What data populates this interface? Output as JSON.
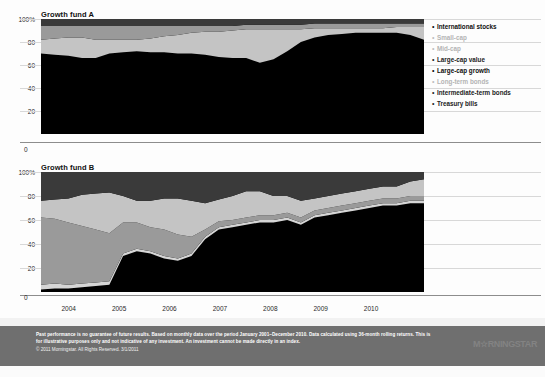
{
  "charts": [
    {
      "title": "Growth fund A",
      "yticks": [
        "100%",
        "80",
        "60",
        "40",
        "20"
      ],
      "zero_label": "0"
    },
    {
      "title": "Growth fund B",
      "yticks": [
        "100%",
        "80",
        "60",
        "40",
        "20"
      ],
      "zero_label": "0"
    }
  ],
  "xaxis": {
    "ticks": [
      "2004",
      "2005",
      "2006",
      "2007",
      "2008",
      "2009",
      "2010"
    ]
  },
  "legend": {
    "items": [
      {
        "label": "International stocks",
        "bullet": "•",
        "emphasis": "strong",
        "color": "#3a3a3a"
      },
      {
        "label": "Small-cap",
        "bullet": "•",
        "emphasis": "faded",
        "color": "#c9c9c9"
      },
      {
        "label": "Mid-cap",
        "bullet": "•",
        "emphasis": "faded",
        "color": "#bdbdbd"
      },
      {
        "label": "Large-cap value",
        "bullet": "•",
        "emphasis": "normal",
        "color": "#9a9a9a"
      },
      {
        "label": "Large-cap growth",
        "bullet": "•",
        "emphasis": "strong",
        "color": "#c4c4c4"
      },
      {
        "label": "Long-term bonds",
        "bullet": "•",
        "emphasis": "faded",
        "color": "#d5d5d5"
      },
      {
        "label": "Intermediate-term bonds",
        "bullet": "•",
        "emphasis": "normal",
        "color": "#1a1a1a"
      },
      {
        "label": "Treasury bills",
        "bullet": "•",
        "emphasis": "normal",
        "color": "#000000"
      }
    ]
  },
  "footer": {
    "disclaimer": "Past performance is no guarantee of future results. Based on monthly data over the period January 2001–December 2010. Data calculated using 36-month rolling returns. This is for illustrative purposes only and not indicative of any investment. An investment cannot be made directly in an index.",
    "copyright": "© 2011 Morningstar. All Rights Reserved. 3/1/2011",
    "logo": "M☆RNINGSTAR"
  },
  "chart_data": {
    "type": "area",
    "xlabel": "",
    "ylabel": "",
    "ylim": [
      0,
      100
    ],
    "grid": true,
    "legend_position": "right",
    "x": [
      "2003-12",
      "2004-03",
      "2004-06",
      "2004-09",
      "2004-12",
      "2005-03",
      "2005-06",
      "2005-09",
      "2005-12",
      "2006-03",
      "2006-06",
      "2006-09",
      "2006-12",
      "2007-03",
      "2007-06",
      "2007-09",
      "2007-12",
      "2008-03",
      "2008-06",
      "2008-09",
      "2008-12",
      "2009-03",
      "2009-06",
      "2009-09",
      "2009-12",
      "2010-03",
      "2010-06",
      "2010-09",
      "2010-12"
    ],
    "panels": [
      {
        "name": "Growth fund A",
        "series": [
          {
            "name": "Treasury bills",
            "color": "#000000",
            "values": [
              70,
              69,
              68,
              66,
              66,
              70,
              71,
              72,
              71,
              71,
              70,
              70,
              69,
              67,
              66,
              66,
              62,
              65,
              72,
              80,
              84,
              86,
              87,
              88,
              88,
              88,
              88,
              86,
              82
            ]
          },
          {
            "name": "Intermediate-term bonds",
            "color": "#1a1a1a",
            "values": [
              0,
              0,
              0,
              0,
              0,
              0,
              0,
              0,
              0,
              0,
              0,
              0,
              0,
              0,
              0,
              0,
              0,
              0,
              0,
              0,
              0,
              0,
              0,
              0,
              0,
              0,
              0,
              0,
              0
            ]
          },
          {
            "name": "Long-term bonds",
            "color": "#d5d5d5",
            "values": [
              0,
              0,
              0,
              0,
              0,
              0,
              0,
              0,
              0,
              0,
              0,
              0,
              0,
              0,
              0,
              0,
              0,
              0,
              0,
              0,
              0,
              0,
              0,
              0,
              0,
              0,
              0,
              0,
              0
            ]
          },
          {
            "name": "Large-cap growth",
            "color": "#c4c4c4",
            "values": [
              12,
              14,
              16,
              18,
              16,
              12,
              11,
              10,
              12,
              14,
              16,
              18,
              20,
              22,
              24,
              25,
              29,
              26,
              19,
              11,
              8,
              6,
              5,
              4,
              4,
              4,
              5,
              7,
              11
            ]
          },
          {
            "name": "Large-cap value",
            "color": "#9a9a9a",
            "values": [
              12,
              11,
              10,
              10,
              12,
              12,
              12,
              12,
              11,
              9,
              8,
              6,
              5,
              5,
              4,
              4,
              4,
              4,
              4,
              4,
              4,
              4,
              4,
              4,
              4,
              4,
              3,
              3,
              3
            ]
          },
          {
            "name": "Mid-cap",
            "color": "#bdbdbd",
            "values": [
              0,
              0,
              0,
              0,
              0,
              0,
              0,
              0,
              0,
              0,
              0,
              0,
              0,
              0,
              0,
              0,
              0,
              0,
              0,
              0,
              0,
              0,
              0,
              0,
              0,
              0,
              0,
              0,
              0
            ]
          },
          {
            "name": "Small-cap",
            "color": "#c9c9c9",
            "values": [
              0,
              0,
              0,
              0,
              0,
              0,
              0,
              0,
              0,
              0,
              0,
              0,
              0,
              0,
              0,
              0,
              0,
              0,
              0,
              0,
              0,
              0,
              0,
              0,
              0,
              0,
              0,
              0,
              0
            ]
          },
          {
            "name": "International stocks",
            "color": "#3a3a3a",
            "values": [
              6,
              6,
              6,
              6,
              6,
              6,
              6,
              6,
              6,
              6,
              6,
              6,
              6,
              6,
              6,
              5,
              5,
              5,
              5,
              5,
              4,
              4,
              4,
              4,
              4,
              4,
              4,
              4,
              4
            ]
          }
        ]
      },
      {
        "name": "Growth fund B",
        "series": [
          {
            "name": "Treasury bills",
            "color": "#000000",
            "values": [
              2,
              3,
              3,
              4,
              5,
              6,
              30,
              34,
              32,
              28,
              26,
              30,
              44,
              52,
              54,
              56,
              58,
              58,
              60,
              56,
              62,
              64,
              66,
              68,
              70,
              72,
              72,
              74,
              74
            ]
          },
          {
            "name": "Intermediate-term bonds",
            "color": "#1a1a1a",
            "values": [
              0,
              0,
              0,
              0,
              0,
              0,
              0,
              0,
              0,
              0,
              0,
              0,
              0,
              0,
              0,
              0,
              0,
              0,
              0,
              0,
              0,
              0,
              0,
              0,
              0,
              0,
              0,
              0,
              0
            ]
          },
          {
            "name": "Long-term bonds",
            "color": "#d5d5d5",
            "values": [
              4,
              4,
              3,
              3,
              3,
              3,
              2,
              2,
              2,
              2,
              2,
              2,
              2,
              2,
              2,
              2,
              2,
              2,
              2,
              2,
              2,
              2,
              2,
              2,
              2,
              2,
              2,
              2,
              2
            ]
          },
          {
            "name": "Large-cap value",
            "color": "#9a9a9a",
            "values": [
              56,
              54,
              52,
              48,
              44,
              40,
              26,
              22,
              20,
              22,
              20,
              14,
              6,
              5,
              4,
              4,
              4,
              4,
              4,
              4,
              4,
              4,
              4,
              4,
              4,
              4,
              4,
              4,
              4
            ]
          },
          {
            "name": "Large-cap growth",
            "color": "#c4c4c4",
            "values": [
              14,
              16,
              20,
              26,
              30,
              34,
              22,
              18,
              22,
              26,
              30,
              30,
              22,
              18,
              20,
              22,
              20,
              16,
              14,
              14,
              10,
              10,
              10,
              10,
              10,
              10,
              10,
              12,
              14
            ]
          },
          {
            "name": "Mid-cap",
            "color": "#bdbdbd",
            "values": [
              0,
              0,
              0,
              0,
              0,
              0,
              0,
              0,
              0,
              0,
              0,
              0,
              0,
              0,
              0,
              0,
              0,
              0,
              0,
              0,
              0,
              0,
              0,
              0,
              0,
              0,
              0,
              0,
              0
            ]
          },
          {
            "name": "Small-cap",
            "color": "#c9c9c9",
            "values": [
              0,
              0,
              0,
              0,
              0,
              0,
              0,
              0,
              0,
              0,
              0,
              0,
              0,
              0,
              0,
              0,
              0,
              0,
              0,
              0,
              0,
              0,
              0,
              0,
              0,
              0,
              0,
              0,
              0
            ]
          },
          {
            "name": "International stocks",
            "color": "#3a3a3a",
            "values": [
              24,
              23,
              22,
              19,
              18,
              17,
              20,
              24,
              24,
              22,
              22,
              24,
              26,
              23,
              20,
              16,
              16,
              20,
              20,
              24,
              22,
              20,
              18,
              16,
              14,
              12,
              12,
              8,
              6
            ]
          }
        ]
      }
    ]
  }
}
